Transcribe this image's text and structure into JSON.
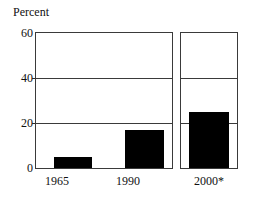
{
  "chart_data": {
    "type": "bar",
    "title": "",
    "ylabel": "Percent",
    "xlabel": "",
    "categories": [
      "1965",
      "1990",
      "2000*"
    ],
    "values": [
      5,
      17,
      25
    ],
    "ylim": [
      0,
      60
    ],
    "yticks": [
      0,
      20,
      40,
      60
    ],
    "ytick_labels": [
      "0",
      "20",
      "40",
      "60"
    ],
    "gridlines": [
      20,
      40
    ],
    "grid": true,
    "legend": "none",
    "bar_color": "#000000",
    "axis_color": "#3a3a3a",
    "note": "2000* shown in a separate panel",
    "series": [
      {
        "name": "Percent",
        "points": [
          {
            "category": "1965",
            "value": 5
          },
          {
            "category": "1990",
            "value": 17
          },
          {
            "category": "2000*",
            "value": 25
          }
        ]
      }
    ]
  },
  "axis": {
    "title": "Percent",
    "ytick_0": "0",
    "ytick_20": "20",
    "ytick_40": "40",
    "ytick_60": "60"
  },
  "xaxis": {
    "label_1": "1965",
    "label_2": "1990",
    "label_3": "2000*"
  }
}
